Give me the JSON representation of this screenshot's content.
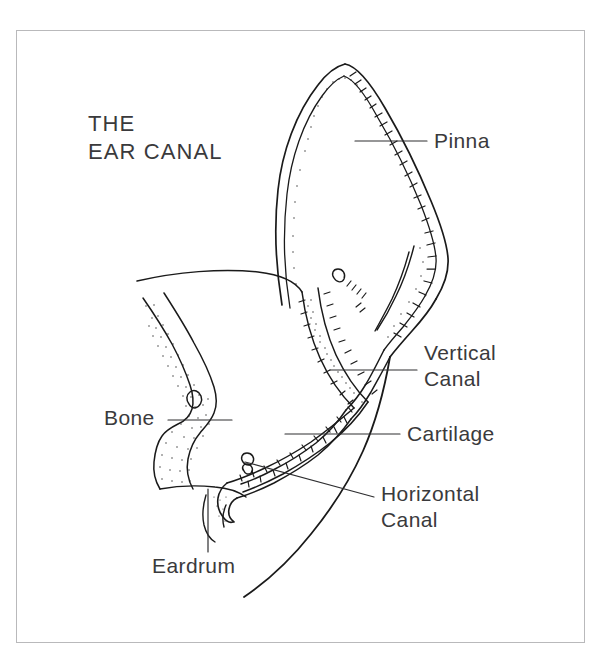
{
  "figure": {
    "title_line1": "THE",
    "title_line2": "EAR CANAL",
    "background_color": "#ffffff",
    "ink_color": "#1a1a1a",
    "border_color": "#b9b9bb",
    "text_color": "#3a3a3c"
  },
  "labels": {
    "pinna": "Pinna",
    "vertical_canal_line1": "Vertical",
    "vertical_canal_line2": "Canal",
    "cartilage": "Cartilage",
    "horizontal_canal_line1": "Horizontal",
    "horizontal_canal_line2": "Canal",
    "bone": "Bone",
    "eardrum": "Eardrum"
  },
  "leader_lines": [
    {
      "name": "pinna-leader",
      "x1": 355,
      "y1": 141,
      "x2": 427,
      "y2": 141
    },
    {
      "name": "vertical-canal-leader",
      "x1": 330,
      "y1": 370,
      "x2": 417,
      "y2": 370
    },
    {
      "name": "cartilage-leader",
      "x1": 285,
      "y1": 434,
      "x2": 400,
      "y2": 434
    },
    {
      "name": "horizontal-canal-leader",
      "x1": 245,
      "y1": 462,
      "x2": 374,
      "y2": 497
    },
    {
      "name": "bone-leader",
      "x1": 168,
      "y1": 420,
      "x2": 232,
      "y2": 420
    },
    {
      "name": "eardrum-leader",
      "x1": 208,
      "y1": 489,
      "x2": 208,
      "y2": 552
    }
  ]
}
